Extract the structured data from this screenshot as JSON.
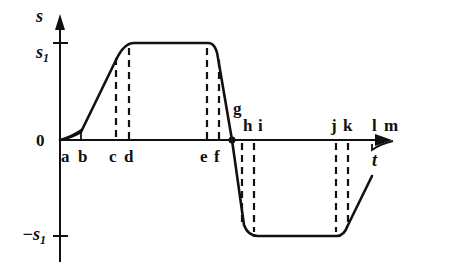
{
  "diagram": {
    "type": "displacement-time profile",
    "y_axis": {
      "label": "s",
      "ticks": {
        "top": "s",
        "top_sub": "1",
        "zero": "0",
        "bottom": "−s",
        "bottom_sub": "1"
      }
    },
    "x_axis": {
      "label": "t"
    },
    "points": [
      "a",
      "b",
      "c",
      "d",
      "e",
      "f",
      "g",
      "h",
      "i",
      "j",
      "k",
      "l",
      "m"
    ],
    "below_axis_labels": [
      "a",
      "b",
      "c",
      "d",
      "e",
      "f"
    ],
    "above_axis_labels": [
      "g",
      "h",
      "i",
      "j",
      "k",
      "l",
      "m"
    ]
  }
}
